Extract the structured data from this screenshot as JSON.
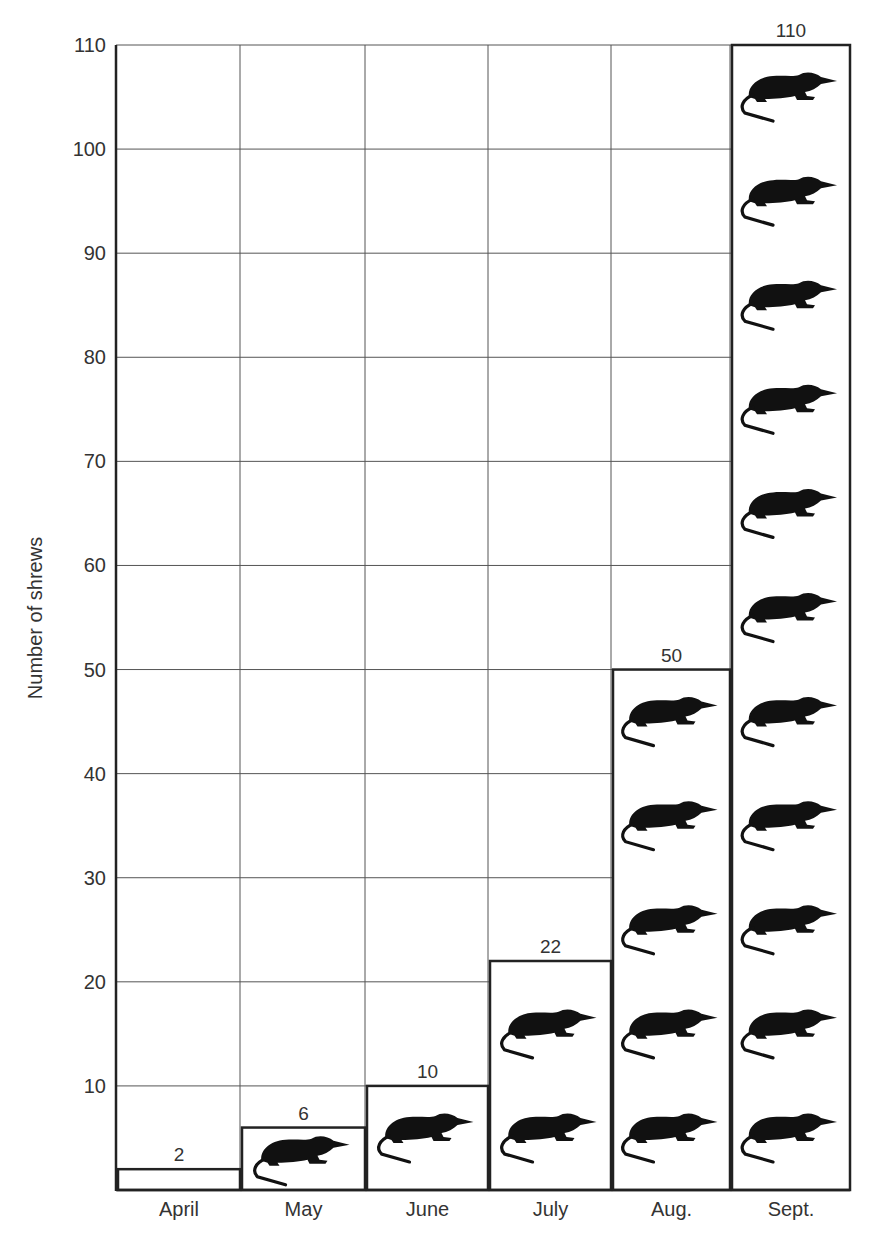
{
  "chart_data": {
    "type": "bar",
    "title": "",
    "xlabel": "",
    "ylabel": "Number of shrews",
    "categories": [
      "April",
      "May",
      "June",
      "July",
      "Aug.",
      "Sept."
    ],
    "values": [
      2,
      6,
      10,
      22,
      50,
      110
    ],
    "value_labels": [
      "2",
      "6",
      "10",
      "22",
      "50",
      "110"
    ],
    "icon_counts": [
      0,
      1,
      1,
      2,
      5,
      11
    ],
    "icon": "shrew-icon",
    "icon_unit": 10,
    "ylim": [
      0,
      110
    ],
    "yticks": [
      10,
      20,
      30,
      40,
      50,
      60,
      70,
      80,
      90,
      100,
      110
    ],
    "ytick_labels": [
      "10",
      "20",
      "30",
      "40",
      "50",
      "60",
      "70",
      "80",
      "90",
      "100",
      "110"
    ],
    "grid": true,
    "legend": "none",
    "colors": {
      "line": "#222222",
      "grid": "#555555",
      "icon": "#111111",
      "text": "#333333"
    }
  }
}
